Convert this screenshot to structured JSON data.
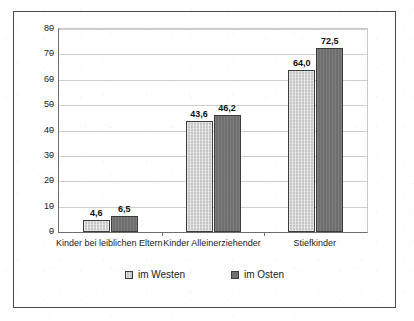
{
  "chart_data": {
    "type": "bar",
    "title": "",
    "subtitle": "",
    "xlabel": "",
    "ylabel": "",
    "ylim": [
      0,
      80
    ],
    "yticks": [
      "0",
      "10",
      "20",
      "30",
      "40",
      "50",
      "60",
      "70",
      "80"
    ],
    "ytick_values": [
      0,
      10,
      20,
      30,
      40,
      50,
      60,
      70,
      80
    ],
    "grid": true,
    "legend_position": "bottom",
    "categories": [
      "Kinder bei leiblichen Eltern",
      "Kinder Alleinerziehender",
      "Stiefkinder"
    ],
    "series": [
      {
        "name": "im Westen",
        "color": "#c6c6c6",
        "values": [
          4.6,
          43.6,
          64.0
        ],
        "labels": [
          "4,6",
          "43,6",
          "64,0"
        ]
      },
      {
        "name": "im Osten",
        "color": "#6f6f6f",
        "values": [
          6.5,
          46.2,
          72.5
        ],
        "labels": [
          "6,5",
          "46,2",
          "72,5"
        ]
      }
    ]
  },
  "legend": {
    "items": [
      {
        "label": "im Westen",
        "swatch": "legend-swatch-west"
      },
      {
        "label": "im Osten",
        "swatch": "legend-swatch-ost"
      }
    ]
  }
}
